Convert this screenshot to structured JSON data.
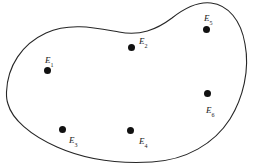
{
  "figure": {
    "type": "sample-space-blob-diagram",
    "width": 255,
    "height": 168,
    "background_color": "#ffffff",
    "outline_color": "#262626",
    "outline_width": 1.1,
    "point_color": "#111111",
    "label_color": "#1a1a1a"
  },
  "outline": {
    "name": "sample-space-boundary",
    "path": "M 6.5 92 C 7.5 66 22 44 46 33 C 70 22 96 28 119 32 C 140 36 156 30 172 18 C 186 7 198 1.5 211 3 C 228 5 241 20 245 44 C 250 70 243 98 230 119 C 214 144 186 160 152 162 C 118 164 84 159 57 147 C 30 135 12 119 8 104 C 6.5 100 6.4 96 6.5 92 Z"
  },
  "points": [
    {
      "id": "E1",
      "label": "E",
      "subscript": "1",
      "dot_x": 47,
      "dot_y": 70,
      "label_x": 45,
      "label_y": 56,
      "region": "left"
    },
    {
      "id": "E2",
      "label": "E",
      "subscript": "2",
      "dot_x": 131,
      "dot_y": 47,
      "label_x": 139,
      "label_y": 37,
      "region": "top-center"
    },
    {
      "id": "E3",
      "label": "E",
      "subscript": "3",
      "dot_x": 62,
      "dot_y": 129,
      "label_x": 69,
      "label_y": 136,
      "region": "bottom-left"
    },
    {
      "id": "E4",
      "label": "E",
      "subscript": "4",
      "dot_x": 130,
      "dot_y": 130,
      "label_x": 139,
      "label_y": 137,
      "region": "bottom-center"
    },
    {
      "id": "E5",
      "label": "E",
      "subscript": "5",
      "dot_x": 206,
      "dot_y": 29,
      "label_x": 204,
      "label_y": 14,
      "region": "top-right"
    },
    {
      "id": "E6",
      "label": "E",
      "subscript": "6",
      "dot_x": 207,
      "dot_y": 93,
      "label_x": 206,
      "label_y": 106,
      "region": "right"
    }
  ]
}
